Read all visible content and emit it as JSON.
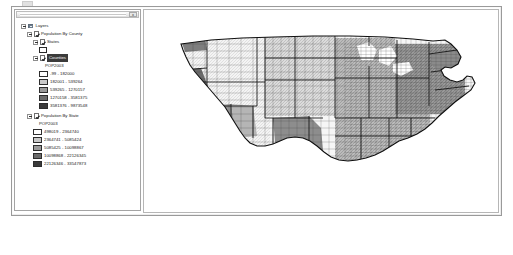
{
  "window": {
    "toc_panel": {
      "titlebar": {
        "close_label": "x"
      },
      "tree": {
        "root": {
          "label": "Layers"
        },
        "groups": [
          {
            "label": "Population By County",
            "checked": true,
            "sublayers": [
              {
                "label": "States",
                "checked": true,
                "selected": false,
                "symbol": "hollow-outline"
              },
              {
                "label": "Counties",
                "checked": true,
                "selected": true,
                "field": "POP2003",
                "classes": [
                  {
                    "range": "-99 - 182000",
                    "color": "#ffffff"
                  },
                  {
                    "range": "182001 - 539264",
                    "color": "#c9c9c9"
                  },
                  {
                    "range": "539265 - 1270157",
                    "color": "#9a9a9a"
                  },
                  {
                    "range": "1270158 - 3581375",
                    "color": "#6b6b6b"
                  },
                  {
                    "range": "3581376 - 9873548",
                    "color": "#3a3a3a"
                  }
                ]
              }
            ]
          },
          {
            "label": "Population By State",
            "checked": true,
            "field": "POP2003",
            "classes": [
              {
                "range": "498019 - 2364740",
                "color": "#ffffff"
              },
              {
                "range": "2364741 - 5085424",
                "color": "#c9c9c9"
              },
              {
                "range": "5085425 - 10098867",
                "color": "#9a9a9a"
              },
              {
                "range": "10098868 - 22126345",
                "color": "#6b6b6b"
              },
              {
                "range": "22126346 - 33547873",
                "color": "#3a3a3a"
              }
            ]
          }
        ]
      }
    },
    "map": {
      "name": "united-states-county-choropleth",
      "background": "#ffffff",
      "outline_color": "#1a1a1a",
      "fills": {
        "lightest": "#f2f2f2",
        "light": "#d6d6d6",
        "mid": "#b0b0b0",
        "dark": "#8a8a8a",
        "darkest": "#5f5f5f"
      }
    }
  }
}
